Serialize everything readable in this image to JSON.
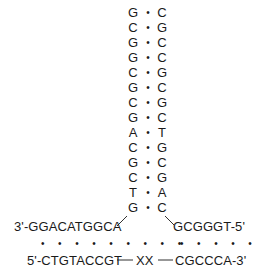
{
  "stem_pairs": [
    {
      "left": "G",
      "right": "C"
    },
    {
      "left": "C",
      "right": "G"
    },
    {
      "left": "G",
      "right": "C"
    },
    {
      "left": "G",
      "right": "C"
    },
    {
      "left": "C",
      "right": "G"
    },
    {
      "left": "G",
      "right": "C"
    },
    {
      "left": "C",
      "right": "G"
    },
    {
      "left": "G",
      "right": "C"
    },
    {
      "left": "A",
      "right": "T"
    },
    {
      "left": "C",
      "right": "G"
    },
    {
      "left": "G",
      "right": "C"
    },
    {
      "left": "C",
      "right": "G"
    },
    {
      "left": "T",
      "right": "A"
    },
    {
      "left": "G",
      "right": "C"
    }
  ],
  "pair_symbol": "•",
  "top_left_strand": "3'-GGACATGGCA",
  "top_right_strand": "GCGGGT-5'",
  "left_dots": "• • • • • • • • •",
  "right_dots": "• • • • • •",
  "bottom_left_strand": "5'-CTGTACCGT",
  "bottom_middle": "XX",
  "bottom_right_strand": "CGCCCA-3'"
}
